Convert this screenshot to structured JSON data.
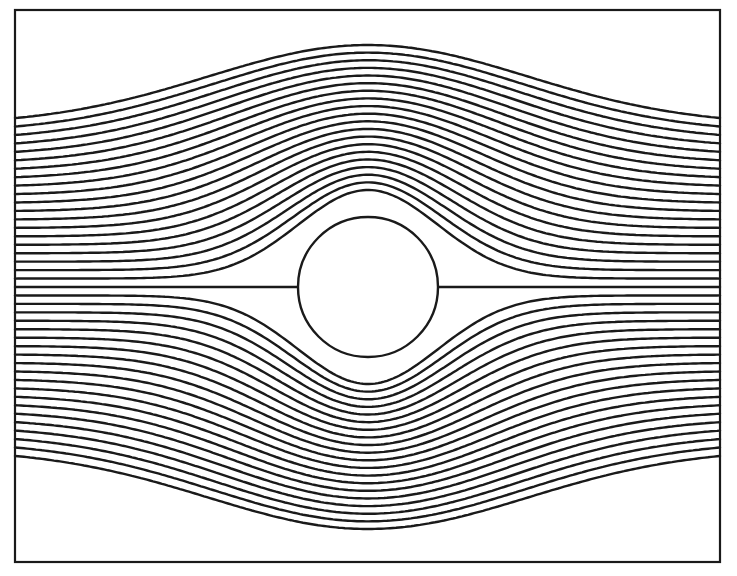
{
  "diagram": {
    "title": "",
    "colors": {
      "line": "#1a1a1a",
      "background": "#ffffff"
    },
    "frame": {
      "left": 15,
      "top": 10,
      "right": 720,
      "bottom": 562
    },
    "cylinder": {
      "cx": 368,
      "cy": 287,
      "r": 70
    },
    "axis_y": 287,
    "streamlines": {
      "count_per_side": 20,
      "far_spacing": 8.45,
      "center_offset_first": 97,
      "center_offset_last": 242,
      "bump_sigma_first": 70,
      "bump_sigma_last": 160,
      "dividing_streamline": true
    }
  }
}
